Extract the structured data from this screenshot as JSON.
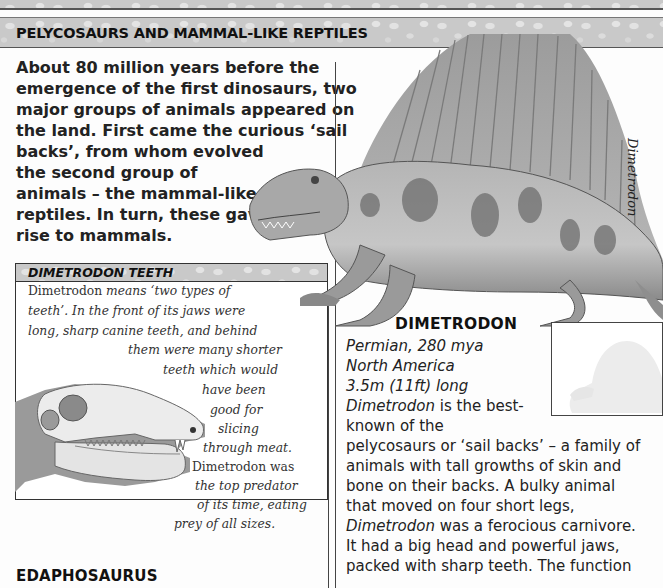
{
  "page": {
    "section_title": "PELYCOSAURS AND MAMMAL-LIKE REPTILES",
    "intro_lines": [
      "About 80 million years before the",
      "emergence of the first dinosaurs, two",
      "major groups of animals appeared on",
      "the land. First came the curious ‘sail",
      "backs’, from whom evolved",
      "the second group of",
      "animals – the mammal-like",
      "reptiles. In turn, these gave",
      "rise to mammals."
    ]
  },
  "teeth_box": {
    "title": "DIMETRODON TEETH",
    "lines": [
      {
        "upright": "Dimetrodon",
        "italic": " means ‘two types of"
      },
      {
        "upright": "",
        "italic": "teeth’. In the front of its jaws were"
      },
      {
        "upright": "",
        "italic": "long, sharp canine teeth, and behind"
      },
      {
        "upright": "",
        "italic": "them were many shorter"
      },
      {
        "upright": "",
        "italic": "teeth which would"
      },
      {
        "upright": "",
        "italic": "have been"
      },
      {
        "upright": "",
        "italic": "good for"
      },
      {
        "upright": "",
        "italic": "slicing"
      },
      {
        "upright": "",
        "italic": "through meat."
      },
      {
        "upright": "Dimetrodon was",
        "italic": ""
      },
      {
        "upright": "",
        "italic": "the top predator"
      },
      {
        "upright": "",
        "italic": "of its time, eating"
      },
      {
        "upright": "",
        "italic": "prey of all sizes."
      }
    ],
    "illustration": "dimetrodon-skull-illustration"
  },
  "edaphosaurus": {
    "title": "EDAPHOSAURUS"
  },
  "dimetrodon": {
    "illustration": "dimetrodon-illustration",
    "side_caption": "Dimetrodon",
    "title": "DIMETRODON",
    "period": "Permian, 280 mya",
    "location": "North America",
    "length": "3.5m (11ft) long",
    "body_lines": [
      {
        "italic": "Dimetrodon",
        "rest": " is the best-"
      },
      {
        "italic": "",
        "rest": "known of the"
      },
      {
        "italic": "",
        "rest": "pelycosaurs or ‘sail backs’ – a family of"
      },
      {
        "italic": "",
        "rest": "animals with tall growths of skin and"
      },
      {
        "italic": "",
        "rest": "bone on their backs. A bulky animal"
      },
      {
        "italic": "",
        "rest": "that moved on four short legs,"
      },
      {
        "italic": "Dimetrodon",
        "rest": " was a ferocious carnivore."
      },
      {
        "italic": "",
        "rest": "It had a big head and powerful jaws,"
      },
      {
        "italic": "",
        "rest": "packed with sharp teeth. The function"
      }
    ],
    "scale_box": "size-comparison-silhouette"
  }
}
